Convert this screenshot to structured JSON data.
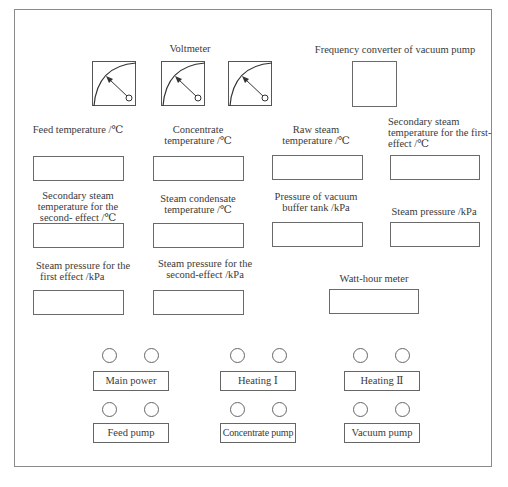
{
  "voltmeter": {
    "label": "Voltmeter",
    "gauges": [
      "voltmeter-1",
      "voltmeter-2",
      "voltmeter-3"
    ]
  },
  "frequency_converter": {
    "label": "Frequency converter of vacuum pump"
  },
  "displays": [
    {
      "id": "feed-temperature",
      "label_lines": [
        "Feed temperature /℃"
      ]
    },
    {
      "id": "concentrate-temperature",
      "label_lines": [
        "Concentrate",
        "temperature /℃"
      ]
    },
    {
      "id": "raw-steam-temperature",
      "label_lines": [
        "Raw steam",
        "temperature /℃"
      ]
    },
    {
      "id": "secondary-steam-temp-first-effect",
      "label_lines": [
        "Secondary steam",
        "temperature for the first-",
        "effect /℃"
      ]
    },
    {
      "id": "secondary-steam-temp-second-effect",
      "label_lines": [
        "Secondary steam",
        "temperature for the",
        "second- effect /℃"
      ]
    },
    {
      "id": "steam-condensate-temperature",
      "label_lines": [
        "Steam condensate",
        "temperature /℃"
      ]
    },
    {
      "id": "vacuum-buffer-tank-pressure",
      "label_lines": [
        "Pressure of vacuum",
        "buffer tank /kPa"
      ]
    },
    {
      "id": "steam-pressure",
      "label_lines": [
        "Steam pressure /kPa"
      ]
    },
    {
      "id": "steam-pressure-first-effect",
      "label_lines": [
        "Steam pressure  for the",
        "first effect /kPa"
      ]
    },
    {
      "id": "steam-pressure-second-effect",
      "label_lines": [
        "Steam  pressure for the",
        "second-effect  /kPa"
      ]
    },
    {
      "id": "watt-hour-meter",
      "label_lines": [
        "Watt-hour meter"
      ]
    }
  ],
  "controls": [
    {
      "id": "main-power",
      "label": "Main power",
      "lamps": 2
    },
    {
      "id": "heating-1",
      "label": "Heating Ⅰ",
      "lamps": 2
    },
    {
      "id": "heating-2",
      "label": "Heating Ⅱ",
      "lamps": 2
    },
    {
      "id": "feed-pump",
      "label": "Feed pump",
      "lamps": 2
    },
    {
      "id": "concentrate-pump",
      "label": "Concentrate pump",
      "lamps": 2
    },
    {
      "id": "vacuum-pump",
      "label": "Vacuum pump",
      "lamps": 2
    }
  ]
}
